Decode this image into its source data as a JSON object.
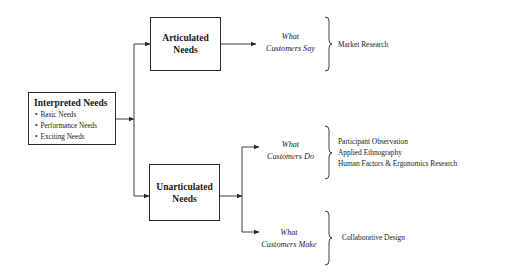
{
  "diagram": {
    "source_box": {
      "title": "Interpreted Needs",
      "items": [
        "Basic Needs",
        "Performance Needs",
        "Exciting Needs"
      ]
    },
    "branches": [
      {
        "box_title_line1": "Articulated",
        "box_title_line2": "Needs",
        "outcomes": [
          {
            "label_line1": "What",
            "label_line2": "Customers Say",
            "methods": [
              "Market Research"
            ]
          }
        ]
      },
      {
        "box_title_line1": "Unarticulated",
        "box_title_line2": "Needs",
        "outcomes": [
          {
            "label_line1": "What",
            "label_line2": "Customers Do",
            "methods": [
              "Participant Observation",
              "Applied Ethnography",
              "Human Factors & Ergonomics Research"
            ]
          },
          {
            "label_line1": "What",
            "label_line2": "Customers Make",
            "methods": [
              "Collaborative Design"
            ]
          }
        ]
      }
    ],
    "colors": {
      "line": "#2a2a2a",
      "text": "#1a1a1a",
      "background": "#ffffff"
    }
  }
}
